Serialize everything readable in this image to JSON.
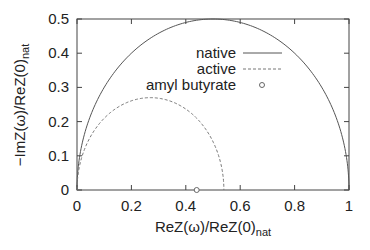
{
  "chart_data": {
    "type": "line",
    "title": "",
    "xlabel": "ReZ(ω)/ReZ(0)",
    "xlabel_sub": "nat",
    "ylabel": "−ImZ(ω)/ReZ(0)",
    "ylabel_sub": "nat",
    "xlim": [
      0,
      1
    ],
    "ylim": [
      0,
      0.5
    ],
    "grid": false,
    "legend_position": "upper-center-right",
    "x_ticks": [
      "0",
      "0.2",
      "0.4",
      "0.6",
      "0.8",
      "1"
    ],
    "y_ticks": [
      "0",
      "0.1",
      "0.2",
      "0.3",
      "0.4",
      "0.5"
    ],
    "series": [
      {
        "name": "native",
        "style": "solid",
        "shape": "semicircle",
        "x_start": 0.0,
        "x_end": 1.0,
        "peak": [
          0.5,
          0.5
        ],
        "x": [
          0,
          0.05,
          0.1,
          0.2,
          0.3,
          0.4,
          0.5,
          0.6,
          0.7,
          0.8,
          0.9,
          0.95,
          1.0
        ],
        "y": [
          0,
          0.218,
          0.3,
          0.4,
          0.458,
          0.49,
          0.5,
          0.49,
          0.458,
          0.4,
          0.3,
          0.218,
          0
        ]
      },
      {
        "name": "active",
        "style": "dashed",
        "shape": "semicircle",
        "x_start": 0.0,
        "x_end": 0.54,
        "peak": [
          0.27,
          0.27
        ],
        "x": [
          0,
          0.05,
          0.1,
          0.15,
          0.2,
          0.27,
          0.35,
          0.4,
          0.45,
          0.5,
          0.54
        ],
        "y": [
          0,
          0.154,
          0.212,
          0.244,
          0.261,
          0.27,
          0.258,
          0.235,
          0.196,
          0.139,
          0
        ]
      },
      {
        "name": "amyl butyrate",
        "style": "marker-circle",
        "x": [
          0.44
        ],
        "y": [
          0.0
        ]
      }
    ]
  }
}
